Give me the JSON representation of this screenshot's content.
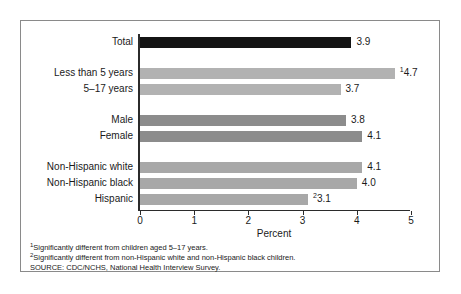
{
  "chart_data": {
    "type": "bar",
    "orientation": "horizontal",
    "title": "",
    "xlabel": "Percent",
    "ylabel": "",
    "xlim": [
      0,
      5
    ],
    "xticks": [
      0,
      1,
      2,
      3,
      4,
      5
    ],
    "xtick_labels": [
      "0",
      "1",
      "2",
      "3",
      "4",
      "5"
    ],
    "grid": false,
    "legend": null,
    "categories": [
      "Total",
      "Less than 5 years",
      "5–17 years",
      "Male",
      "Female",
      "Non-Hispanic white",
      "Non-Hispanic black",
      "Hispanic"
    ],
    "values": [
      3.9,
      4.7,
      3.7,
      3.8,
      4.1,
      4.1,
      4.0,
      3.1
    ],
    "value_labels": [
      "3.9",
      "4.7",
      "3.7",
      "3.8",
      "4.1",
      "4.1",
      "4.0",
      "3.1"
    ],
    "value_label_superscripts": [
      "",
      "1",
      "",
      "",
      "",
      "",
      "",
      "2"
    ],
    "bar_colors": [
      "#141414",
      "#b2b2b2",
      "#b2b2b2",
      "#8c8c8c",
      "#8c8c8c",
      "#a8a8a8",
      "#a8a8a8",
      "#a8a8a8"
    ],
    "groups": [
      {
        "name": "total",
        "category_indexes": [
          0
        ]
      },
      {
        "name": "age",
        "category_indexes": [
          1,
          2
        ]
      },
      {
        "name": "sex",
        "category_indexes": [
          3,
          4
        ]
      },
      {
        "name": "race-ethnicity",
        "category_indexes": [
          5,
          6,
          7
        ]
      }
    ]
  },
  "footnotes": [
    {
      "marker": "1",
      "text": "Significantly different from children aged 5–17 years."
    },
    {
      "marker": "2",
      "text": "Significantly different from non-Hispanic white and non-Hispanic black children."
    }
  ],
  "source": "SOURCE: CDC/NCHS, National Health Interview Survey."
}
